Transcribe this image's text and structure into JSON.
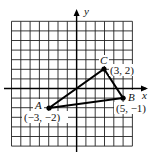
{
  "diagram": {
    "type": "coordinate-plane-triangle",
    "axes": {
      "x_label": "x",
      "y_label": "y"
    },
    "grid": {
      "x_min": -7,
      "x_max": 6,
      "y_min": -6,
      "y_max": 7,
      "step": 1
    },
    "points": [
      {
        "name": "A",
        "x": -3,
        "y": -2,
        "coord_label": "(−3, −2)"
      },
      {
        "name": "B",
        "x": 5,
        "y": -1,
        "coord_label": "(5, −1)"
      },
      {
        "name": "C",
        "x": 3,
        "y": 2,
        "coord_label": "(3, 2)"
      }
    ],
    "segments": [
      [
        "A",
        "B"
      ],
      [
        "B",
        "C"
      ],
      [
        "C",
        "A"
      ]
    ],
    "colors": {
      "ink": "#111111",
      "grid": "#222222",
      "background": "#ffffff"
    }
  }
}
